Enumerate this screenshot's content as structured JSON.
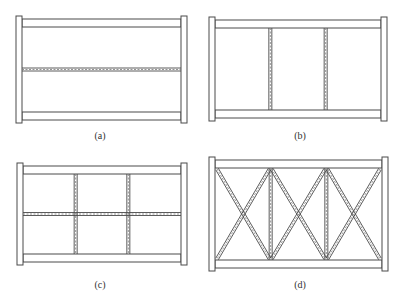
{
  "figure": {
    "panels": [
      {
        "id": "a",
        "label": "(a)",
        "type": "horizontal-rails",
        "verticals": 0,
        "mid_horizontal": true,
        "diagonals": false
      },
      {
        "id": "b",
        "label": "(b)",
        "type": "vertical-posts",
        "verticals": 2,
        "mid_horizontal": false,
        "diagonals": false
      },
      {
        "id": "c",
        "label": "(c)",
        "type": "grid",
        "verticals": 2,
        "mid_horizontal": true,
        "diagonals": false
      },
      {
        "id": "d",
        "label": "(d)",
        "type": "cross-braced",
        "verticals": 2,
        "mid_horizontal": false,
        "diagonals": true
      }
    ],
    "colors": {
      "stroke": "#4a4a4a",
      "dashed": "#7a7a7a",
      "fill": "#ffffff"
    }
  }
}
